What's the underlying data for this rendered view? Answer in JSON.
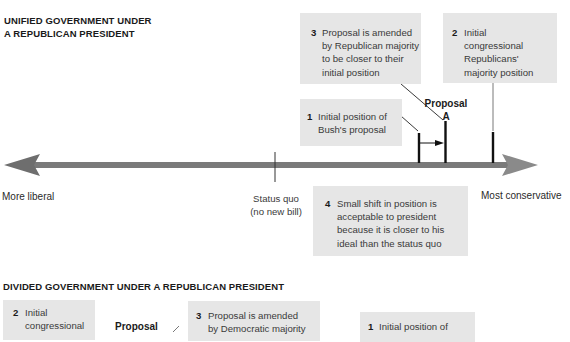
{
  "unified": {
    "title_line1": "UNIFIED GOVERNMENT UNDER",
    "title_line2": "A REPUBLICAN PRESIDENT",
    "box1": {
      "num": "1",
      "text": "Initial position of\nBush's proposal"
    },
    "box2": {
      "num": "2",
      "text": "Initial\ncongressional\nRepublicans'\nmajority position"
    },
    "box3": {
      "num": "3",
      "text": "Proposal is amended\nby Republican majority\nto be closer to their\ninitial position"
    },
    "box4": {
      "num": "4",
      "text": "Small shift in position is\nacceptable to president\nbecause it is closer to his\nideal than the status quo"
    },
    "proposal_label": "Proposal\nA",
    "status_quo_label": "Status quo\n(no new bill)",
    "left_label": "More liberal",
    "right_label": "Most conservative"
  },
  "divided": {
    "title": "DIVIDED GOVERNMENT UNDER A REPUBLICAN PRESIDENT",
    "box2": {
      "num": "2",
      "text": "Initial\ncongressional"
    },
    "box3": {
      "num": "3",
      "text": "Proposal is amended\nby Democratic majority"
    },
    "box1": {
      "num": "1",
      "text": "Initial position of"
    },
    "proposal_label": "Proposal"
  },
  "colors": {
    "axis": "#7a7a7a",
    "box_bg": "#e6e6e6",
    "tick": "#111111"
  }
}
